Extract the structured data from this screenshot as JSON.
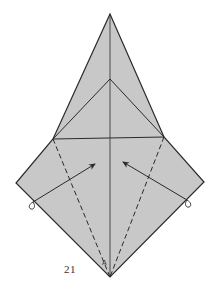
{
  "diagram": {
    "type": "origami-fold-step",
    "step_number": "21",
    "point_label": "A",
    "caption": "",
    "colors": {
      "paper_fill": "#c8c8c8",
      "line": "#2a2a2a",
      "background": "#ffffff"
    },
    "vertices": {
      "top_tip": [
        110,
        14
      ],
      "inner_apex": [
        110,
        79
      ],
      "left_junction": [
        53,
        139
      ],
      "right_junction": [
        164,
        137
      ],
      "left_corner": [
        16,
        183
      ],
      "right_corner": [
        204,
        182
      ],
      "bottom_tip": [
        110,
        277
      ]
    },
    "arrows": [
      {
        "name": "left-fold-arrow",
        "from": [
          33,
          202
        ],
        "to": [
          95,
          164
        ]
      },
      {
        "name": "right-fold-arrow",
        "from": [
          187,
          200
        ],
        "to": [
          123,
          162
        ]
      }
    ],
    "valley_folds": [
      {
        "name": "left-valley-fold",
        "from": [
          53,
          139
        ],
        "to": [
          110,
          277
        ]
      },
      {
        "name": "right-valley-fold",
        "from": [
          164,
          137
        ],
        "to": [
          110,
          277
        ]
      }
    ]
  }
}
